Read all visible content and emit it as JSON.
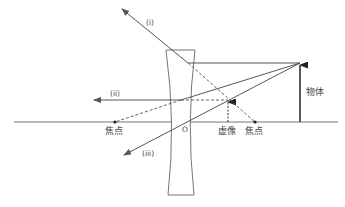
{
  "diagram": {
    "colors": {
      "line": "#555555",
      "axis": "#777777",
      "text": "#444444",
      "background": "#ffffff"
    },
    "labels": {
      "ray_1": "(i)",
      "ray_2": "(ii)",
      "ray_3": "(iii)",
      "object": "物体",
      "virtual_image": "虚像",
      "focus_left": "焦点",
      "focus_right": "焦点",
      "lens_center": "O"
    },
    "geometry": {
      "axis": {
        "x1": 14,
        "x2": 338,
        "y": 122
      },
      "lens_center": {
        "x": 180,
        "y": 122
      },
      "focus_left": {
        "x": 115,
        "y": 122
      },
      "focus_right": {
        "x": 255,
        "y": 122
      },
      "object": {
        "x": 300,
        "base_y": 122,
        "tip_y": 63
      },
      "virtual_image": {
        "x": 228,
        "base_y": 122,
        "tip_y": 100
      }
    }
  }
}
